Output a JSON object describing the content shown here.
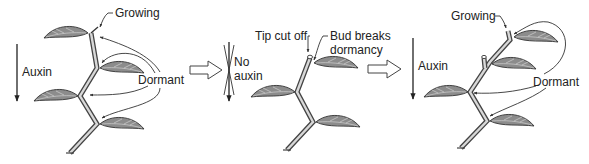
{
  "diagram": {
    "colors": {
      "leaf_fill": "#8c8c8c",
      "outline": "#333333",
      "stem_inner": "#d8d8d8",
      "background": "#ffffff"
    },
    "panels": [
      {
        "id": "intact-plant",
        "labels": {
          "auxin": "Auxin",
          "growing": "Growing",
          "dormant": "Dormant"
        }
      },
      {
        "id": "tip-removed",
        "labels": {
          "no": "No",
          "auxin": "auxin",
          "tip_cut_off": "Tip cut off",
          "bud_breaks_line1": "Bud breaks",
          "bud_breaks_line2": "dormancy"
        }
      },
      {
        "id": "new-leader",
        "labels": {
          "auxin": "Auxin",
          "growing": "Growing",
          "dormant": "Dormant"
        }
      }
    ],
    "transitions": [
      {
        "from": "intact-plant",
        "to": "tip-removed",
        "icon": "hollow-right-arrow"
      },
      {
        "from": "tip-removed",
        "to": "new-leader",
        "icon": "hollow-right-arrow"
      }
    ]
  }
}
